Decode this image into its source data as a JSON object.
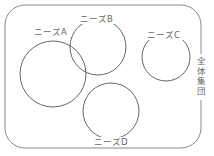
{
  "diagram": {
    "type": "venn",
    "colors": {
      "stroke": "#666666",
      "frame": "#888888",
      "text": "#666666",
      "background": "#ffffff"
    },
    "universe": {
      "label": "全体集団",
      "x": 5,
      "y": 5,
      "w": 196,
      "h": 143,
      "r": 20
    },
    "sets": [
      {
        "id": "A",
        "label": "ニーズA",
        "cx": 53,
        "cy": 74,
        "r": 33,
        "label_x": 34,
        "label_y": 35
      },
      {
        "id": "B",
        "label": "ニーズB",
        "cx": 98,
        "cy": 47,
        "r": 28,
        "label_x": 80,
        "label_y": 22
      },
      {
        "id": "C",
        "label": "ニーズC",
        "cx": 166,
        "cy": 57,
        "r": 24,
        "label_x": 147,
        "label_y": 38
      },
      {
        "id": "D",
        "label": "ニーズD",
        "cx": 111,
        "cy": 111,
        "r": 28,
        "label_x": 94,
        "label_y": 145
      }
    ]
  }
}
